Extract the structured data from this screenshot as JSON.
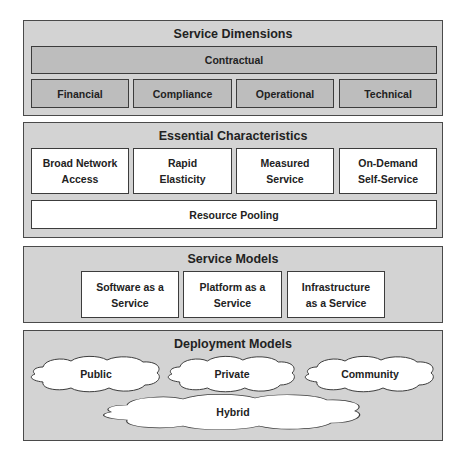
{
  "diagram": {
    "colors": {
      "section_bg": "#d3d3d3",
      "dimension_box_bg": "#bdbdbd",
      "white_box_bg": "#ffffff",
      "border": "#3c3c3c"
    },
    "service_dimensions": {
      "title": "Service Dimensions",
      "top_item": "Contractual",
      "items": [
        "Financial",
        "Compliance",
        "Operational",
        "Technical"
      ]
    },
    "essential_characteristics": {
      "title": "Essential Characteristics",
      "items": [
        {
          "line1": "Broad Network",
          "line2": "Access"
        },
        {
          "line1": "Rapid",
          "line2": "Elasticity"
        },
        {
          "line1": "Measured",
          "line2": "Service"
        },
        {
          "line1": "On-Demand",
          "line2": "Self-Service"
        }
      ],
      "bottom_item": "Resource Pooling"
    },
    "service_models": {
      "title": "Service Models",
      "items": [
        {
          "line1": "Software as a",
          "line2": "Service"
        },
        {
          "line1": "Platform as a",
          "line2": "Service"
        },
        {
          "line1": "Infrastructure",
          "line2": "as a Service"
        }
      ]
    },
    "deployment_models": {
      "title": "Deployment Models",
      "items": [
        "Public",
        "Private",
        "Community",
        "Hybrid"
      ]
    }
  }
}
